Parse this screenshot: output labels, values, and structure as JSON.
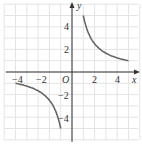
{
  "chart_data": {
    "type": "line",
    "title": "",
    "xlabel": "x",
    "ylabel": "y",
    "origin_label": "O",
    "xlim": [
      -5.5,
      5.5
    ],
    "ylim": [
      -5.5,
      5.5
    ],
    "grid": true,
    "x_ticks": [
      -4,
      -2,
      2,
      4
    ],
    "y_ticks": [
      4,
      2,
      -2,
      -4
    ],
    "x_tick_labels": [
      "−4",
      "−2",
      "2",
      "4"
    ],
    "y_tick_labels": [
      "4",
      "2",
      "−2",
      "−4"
    ],
    "series": [
      {
        "name": "y = 5/x (x>0)",
        "x": [
          1,
          1.25,
          1.5,
          2,
          2.5,
          3,
          3.5,
          4,
          4.5,
          5
        ],
        "y": [
          5,
          4,
          3.33,
          2.5,
          2,
          1.67,
          1.43,
          1.25,
          1.11,
          1
        ]
      },
      {
        "name": "y = 5/x (x<0)",
        "x": [
          -5,
          -4.5,
          -4,
          -3.5,
          -3,
          -2.5,
          -2,
          -1.5,
          -1.25,
          -1
        ],
        "y": [
          -1,
          -1.11,
          -1.25,
          -1.43,
          -1.67,
          -2,
          -2.5,
          -3.33,
          -4,
          -5
        ]
      }
    ],
    "colors": {
      "curve": "#666666",
      "axis": "#333333",
      "grid": "#e4e4e4"
    }
  }
}
